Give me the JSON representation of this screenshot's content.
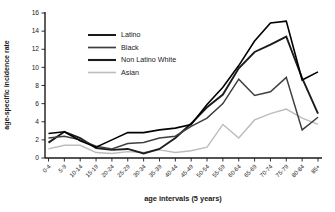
{
  "figure": {
    "background": "#ffffff"
  },
  "chart_data": {
    "type": "line",
    "title": "",
    "xlabel": "age intervals (5 years)",
    "ylabel": "age-specific incidence rate",
    "ylim": [
      0,
      16
    ],
    "ytick_step": 2,
    "yticks": [
      0,
      2,
      4,
      6,
      8,
      10,
      12,
      14,
      16
    ],
    "grid": false,
    "legend_position": "upper-left-inside",
    "categories": [
      "0-4",
      "5-9",
      "10-14",
      "15-19",
      "20-24",
      "25-29",
      "30-34",
      "35-39",
      "40-44",
      "45-49",
      "50-54",
      "55-59",
      "60-64",
      "65-69",
      "70-74",
      "75-79",
      "80-84",
      "85+"
    ],
    "series": [
      {
        "name": "Latino",
        "color": "#000000",
        "stroke_width": 1.6,
        "values": [
          2.7,
          2.9,
          1.9,
          1.2,
          2.0,
          2.8,
          2.8,
          3.1,
          3.3,
          3.7,
          5.9,
          7.8,
          10.2,
          12.9,
          14.9,
          15.1,
          8.6,
          9.5
        ]
      },
      {
        "name": "Black",
        "color": "#3f3f3f",
        "stroke_width": 1.5,
        "values": [
          2.2,
          2.4,
          2.0,
          1.3,
          1.0,
          1.6,
          1.7,
          2.2,
          2.4,
          3.5,
          4.4,
          6.0,
          8.7,
          6.9,
          7.3,
          8.9,
          3.1,
          4.5
        ]
      },
      {
        "name": "Non Latino White",
        "color": "#1c1c1c",
        "stroke_width": 1.9,
        "values": [
          1.7,
          2.9,
          2.2,
          1.1,
          0.9,
          1.0,
          0.5,
          1.0,
          2.2,
          3.8,
          5.6,
          7.0,
          9.9,
          11.7,
          12.5,
          13.4,
          8.8,
          4.9
        ]
      },
      {
        "name": "Asian",
        "color": "#bcbcbc",
        "stroke_width": 1.4,
        "values": [
          1.0,
          1.4,
          1.4,
          0.6,
          0.5,
          0.7,
          0.6,
          0.9,
          0.6,
          0.8,
          1.2,
          3.7,
          2.2,
          4.2,
          4.9,
          5.4,
          4.4,
          3.7
        ]
      }
    ]
  }
}
